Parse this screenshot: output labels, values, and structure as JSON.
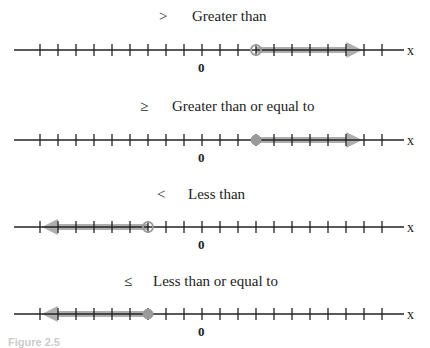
{
  "panels": [
    {
      "symbol": ">",
      "label": "Greater than",
      "boundary_tick": 3,
      "circle": "open",
      "direction": "right"
    },
    {
      "symbol": "≥",
      "label": "Greater than or equal to",
      "boundary_tick": 3,
      "circle": "closed",
      "direction": "right"
    },
    {
      "symbol": "<",
      "label": "Less than",
      "boundary_tick": -3,
      "circle": "open",
      "direction": "left"
    },
    {
      "symbol": "≤",
      "label": "Less than or equal to",
      "boundary_tick": -3,
      "circle": "closed",
      "direction": "left"
    }
  ],
  "axis": {
    "variable": "x",
    "origin_label": "0",
    "tick_min": -9,
    "tick_max": 10
  },
  "caption": "Figure 2.5",
  "colors": {
    "line": "#222222",
    "shade": "#9a9a9a"
  }
}
